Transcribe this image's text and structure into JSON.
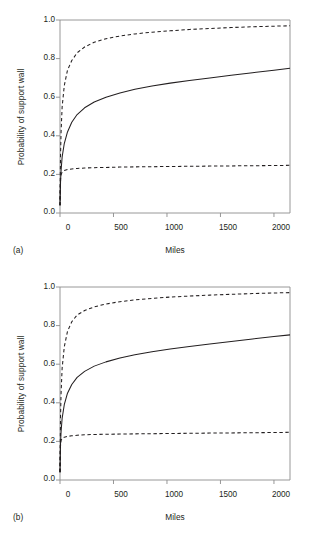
{
  "figure": {
    "background": "#ffffff",
    "axis_color": "#8c8c8c",
    "line_color": "#231f20"
  },
  "panels": [
    {
      "tag": "(a)",
      "xlabel": "Miles",
      "ylabel": "Probability of support wall",
      "yticks": [
        "1.0",
        "0.8",
        "0.6",
        "0.4",
        "0.2",
        "0.0"
      ],
      "xticks": [
        "0",
        "500",
        "1000",
        "1500",
        "2000"
      ]
    },
    {
      "tag": "(b)",
      "xlabel": "Miles",
      "ylabel": "Probability of support wall",
      "yticks": [
        "1.0",
        "0.8",
        "0.6",
        "0.4",
        "0.2",
        "0.0"
      ],
      "xticks": [
        "0",
        "500",
        "1000",
        "1500",
        "2000"
      ]
    }
  ],
  "chart_data": [
    {
      "type": "line",
      "panel": "(a)",
      "title": "",
      "xlabel": "Miles",
      "ylabel": "Probability of support wall",
      "xlim": [
        0,
        2150
      ],
      "ylim": [
        0.0,
        1.0
      ],
      "xticks": [
        0,
        500,
        1000,
        1500,
        2000
      ],
      "yticks": [
        0.0,
        0.2,
        0.4,
        0.6,
        0.8,
        1.0
      ],
      "grid": false,
      "legend": "none",
      "x": [
        0,
        5,
        10,
        20,
        40,
        70,
        110,
        160,
        230,
        320,
        430,
        560,
        700,
        860,
        1030,
        1210,
        1400,
        1600,
        1800,
        2000,
        2150
      ],
      "series": [
        {
          "name": "upper bound",
          "style": "dashed",
          "values": [
            0.04,
            0.3,
            0.42,
            0.55,
            0.66,
            0.74,
            0.79,
            0.83,
            0.86,
            0.885,
            0.903,
            0.917,
            0.928,
            0.937,
            0.944,
            0.951,
            0.956,
            0.961,
            0.965,
            0.968,
            0.97
          ]
        },
        {
          "name": "estimate",
          "style": "solid",
          "values": [
            0.04,
            0.16,
            0.22,
            0.29,
            0.36,
            0.42,
            0.47,
            0.51,
            0.545,
            0.575,
            0.6,
            0.622,
            0.641,
            0.658,
            0.673,
            0.687,
            0.7,
            0.714,
            0.727,
            0.74,
            0.75
          ]
        },
        {
          "name": "lower bound",
          "style": "dashed",
          "values": [
            0.04,
            0.175,
            0.198,
            0.212,
            0.22,
            0.225,
            0.228,
            0.231,
            0.233,
            0.235,
            0.236,
            0.238,
            0.239,
            0.24,
            0.241,
            0.242,
            0.243,
            0.244,
            0.245,
            0.246,
            0.247
          ]
        }
      ]
    },
    {
      "type": "line",
      "panel": "(b)",
      "title": "",
      "xlabel": "Miles",
      "ylabel": "Probability of support wall",
      "xlim": [
        0,
        2150
      ],
      "ylim": [
        0.0,
        1.0
      ],
      "xticks": [
        0,
        500,
        1000,
        1500,
        2000
      ],
      "yticks": [
        0.0,
        0.2,
        0.4,
        0.6,
        0.8,
        1.0
      ],
      "grid": false,
      "legend": "none",
      "x": [
        0,
        5,
        10,
        20,
        40,
        70,
        110,
        160,
        230,
        320,
        430,
        560,
        700,
        860,
        1030,
        1210,
        1400,
        1600,
        1800,
        2000,
        2150
      ],
      "series": [
        {
          "name": "upper bound",
          "style": "dashed",
          "values": [
            0.04,
            0.33,
            0.45,
            0.58,
            0.69,
            0.77,
            0.82,
            0.855,
            0.878,
            0.897,
            0.912,
            0.924,
            0.933,
            0.941,
            0.948,
            0.953,
            0.958,
            0.962,
            0.966,
            0.969,
            0.971
          ]
        },
        {
          "name": "estimate",
          "style": "solid",
          "values": [
            0.04,
            0.19,
            0.25,
            0.32,
            0.39,
            0.45,
            0.495,
            0.532,
            0.563,
            0.59,
            0.612,
            0.632,
            0.649,
            0.665,
            0.679,
            0.692,
            0.705,
            0.718,
            0.731,
            0.743,
            0.752
          ]
        },
        {
          "name": "lower bound",
          "style": "dashed",
          "values": [
            0.04,
            0.185,
            0.205,
            0.216,
            0.222,
            0.226,
            0.229,
            0.232,
            0.234,
            0.236,
            0.237,
            0.238,
            0.239,
            0.24,
            0.241,
            0.242,
            0.243,
            0.244,
            0.245,
            0.246,
            0.247
          ]
        }
      ]
    }
  ]
}
